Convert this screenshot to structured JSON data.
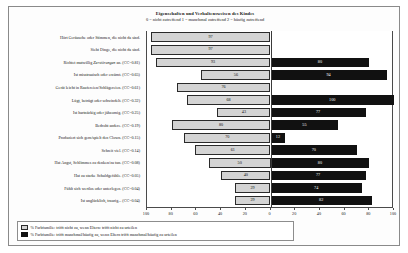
{
  "chart_data": {
    "type": "bar",
    "orientation": "horizontal-diverging",
    "title": "Eigenschaften und Verhaltensweisen des Kindes",
    "subtitle": "0 = nicht zutreffend 1 = manchmal zutreffend 2 = häufig zutreffend",
    "xlabel": "",
    "ylabel": "",
    "grid": false,
    "legend_position": "bottom-left",
    "xlim": [
      -100,
      100
    ],
    "axis_ticks": [
      "100",
      "80",
      "60",
      "40",
      "20",
      "0",
      "20",
      "40",
      "60",
      "80",
      "100"
    ],
    "axis_tick_values": [
      -100,
      -80,
      -60,
      -40,
      -20,
      0,
      20,
      40,
      60,
      80,
      100
    ],
    "categories": [
      "Hört Geräusche oder Stimmen, die nicht da sind.",
      "Sieht Dinge, die nicht da sind.",
      "Richtet mutwillig Zerstörungen an. (CC=0.81)",
      "Ist misstrauisch oder erzürnt. (CC=0.65)",
      "Gerät leicht in Raufereien/Schlägereien. (CC=0.61)",
      "Lügt, betrügt oder schwindelt. (CC=0.32)",
      "Ist hartnäckig oder jähzornig. (CC=0.25)",
      "Bedroht andere. (CC=0.19)",
      "Produziert sich gern/spielt den Clown. (CC=0.15)",
      "Schreit viel. (CC=0.14)",
      "Hat Angst, Schlimmes zu denken/zu tun. (CC=0.08)",
      "Hat zu starke Schuldgefühle. (CC=0.05)",
      "Fühlt sich wertlos oder unterlegen. (CC=0.04)",
      "Ist unglücklich, traurig... (CC=0.04)"
    ],
    "categories_italic_word": [
      "",
      "",
      "Zerstörungen",
      "",
      "",
      "",
      "",
      "",
      "",
      "",
      "",
      "",
      "",
      ""
    ],
    "series": [
      {
        "name": "% Farbfamilie: trifft nicht zu, wenn Eltern: trifft nicht zu urteilen",
        "color": "#d4d4d4",
        "side": "left",
        "values": [
          97,
          97,
          93,
          56,
          76,
          68,
          43,
          80,
          70,
          61,
          50,
          40,
          29,
          29
        ]
      },
      {
        "name": "% Farbfamilie: trifft manchmal/häufig zu, wenn Eltern trifft manchmal/häufig zu urteilen",
        "color": "#111111",
        "side": "right",
        "values": [
          0,
          0,
          80,
          94,
          0,
          100,
          77,
          55,
          12,
          70,
          80,
          77,
          74,
          82
        ]
      }
    ]
  },
  "legend": {
    "entries": [
      {
        "label": "% Farbfamilie: trifft nicht zu, wenn Eltern: trifft nicht zu urteilen",
        "swatch": "grey"
      },
      {
        "label": "% Farbfamilie: trifft manchmal/häufig zu, wenn Eltern trifft manchmal/häufig zu urteilen",
        "swatch": "black"
      }
    ]
  }
}
